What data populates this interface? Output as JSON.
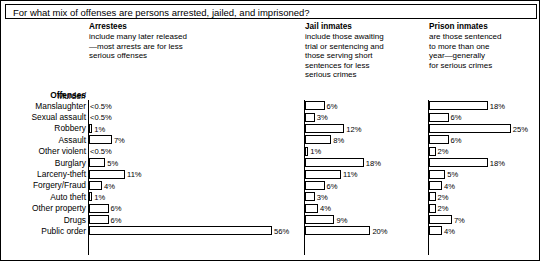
{
  "title": "For what mix of offenses are persons arrested, jailed, and imprisoned?",
  "offenses_header": "Offenses",
  "columns": [
    {
      "key": "arrestees",
      "title": "Arrestees",
      "desc_lines": [
        "include many later released",
        "—most arrests are for less",
        "serious offenses"
      ]
    },
    {
      "key": "jail",
      "title": "Jail inmates",
      "desc_lines": [
        "include those awaiting",
        "trial or sentencing and",
        "those serving short",
        "sentences for less",
        "serious crimes"
      ]
    },
    {
      "key": "prison",
      "title": "Prison inmates",
      "desc_lines": [
        "are those sentenced",
        "to more than one",
        "year—generally",
        "for serious crimes"
      ]
    }
  ],
  "chart_data": {
    "type": "bar",
    "title": "For what mix of offenses are persons arrested, jailed, and imprisoned?",
    "xlabel": "",
    "ylabel": "Offenses",
    "orientation": "horizontal",
    "grid": false,
    "legend": "none",
    "xlim": [
      0,
      56
    ],
    "categories": [
      "Murder/ Manslaughter",
      "Sexual assault",
      "Robbery",
      "Assault",
      "Other violent",
      "Burglary",
      "Larceny-theft",
      "Forgery/Fraud",
      "Auto theft",
      "Other property",
      "Drugs",
      "Public order"
    ],
    "category_labels": [
      {
        "line1": "Murder/",
        "line2": "Manslaughter"
      },
      {
        "line1": "",
        "line2": "Sexual assault"
      },
      {
        "line1": "",
        "line2": "Robbery"
      },
      {
        "line1": "",
        "line2": "Assault"
      },
      {
        "line1": "",
        "line2": "Other violent"
      },
      {
        "line1": "",
        "line2": "Burglary"
      },
      {
        "line1": "",
        "line2": "Larceny-theft"
      },
      {
        "line1": "",
        "line2": "Forgery/Fraud"
      },
      {
        "line1": "",
        "line2": "Auto theft"
      },
      {
        "line1": "",
        "line2": "Other property"
      },
      {
        "line1": "",
        "line2": "Drugs"
      },
      {
        "line1": "",
        "line2": "Public order"
      }
    ],
    "series": [
      {
        "name": "Arrestees",
        "values": [
          0.4,
          0.4,
          1,
          7,
          0.4,
          5,
          11,
          4,
          1,
          6,
          6,
          56
        ],
        "labels": [
          "<0.5%",
          "<0.5%",
          "1%",
          "7%",
          "<0.5%",
          "5%",
          "11%",
          "4%",
          "1%",
          "6%",
          "6%",
          "56%"
        ]
      },
      {
        "name": "Jail inmates",
        "values": [
          6,
          3,
          12,
          8,
          1,
          18,
          11,
          6,
          3,
          4,
          9,
          20
        ],
        "labels": [
          "6%",
          "3%",
          "12%",
          "8%",
          "1%",
          "18%",
          "11%",
          "6%",
          "3%",
          "4%",
          "9%",
          "20%"
        ]
      },
      {
        "name": "Prison inmates",
        "values": [
          18,
          6,
          25,
          6,
          2,
          18,
          5,
          4,
          2,
          2,
          7,
          4
        ],
        "labels": [
          "18%",
          "6%",
          "25%",
          "6%",
          "2%",
          "18%",
          "5%",
          "4%",
          "2%",
          "2%",
          "7%",
          "4%"
        ]
      }
    ]
  },
  "colors": {
    "ink": "#000000",
    "paper": "#ffffff"
  }
}
